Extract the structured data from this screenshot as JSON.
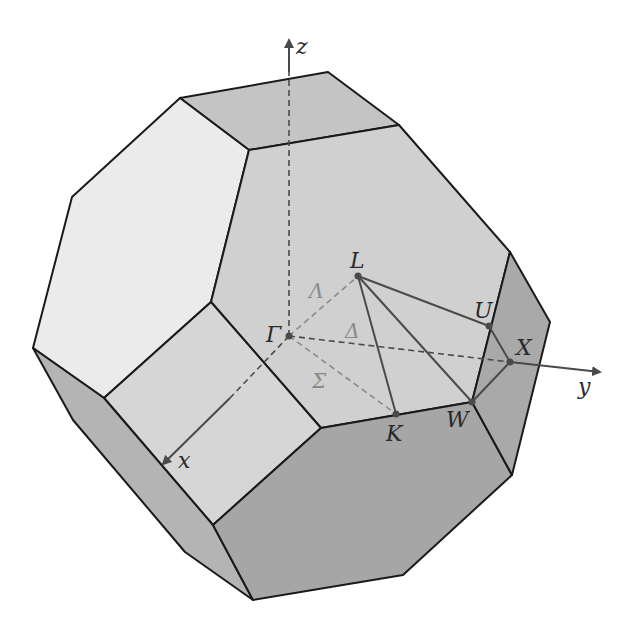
{
  "figure": {
    "axes": {
      "x": "x",
      "y": "y",
      "z": "z"
    },
    "points": {
      "gamma": "Γ",
      "L": "L",
      "K": "K",
      "W": "W",
      "U": "U",
      "X": "X"
    },
    "lines": {
      "lambda": "Λ",
      "delta": "Δ",
      "sigma": "Σ"
    },
    "colors": {
      "face_light": "#ebebeb",
      "face_mid": "#cfcfcf",
      "face_top": "#c4c4c4",
      "face_dark": "#a9a9a9",
      "face_bottom": "#a3a3a3",
      "edge": "#1a1a1a",
      "path_line": "#4a4a4a",
      "symmetry_label": "#8a8a8a"
    }
  }
}
